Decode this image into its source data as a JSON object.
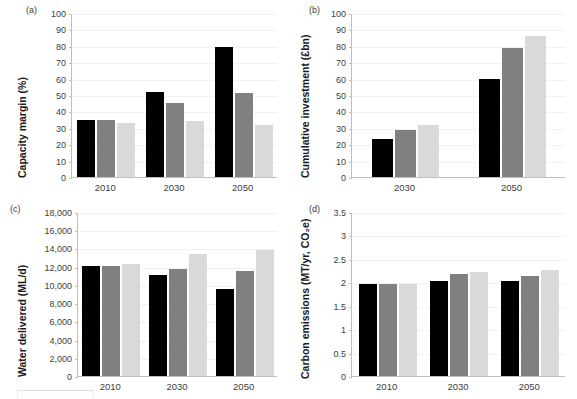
{
  "figure": {
    "panels": [
      {
        "tag": "(a)",
        "ylabel": "Capacity margin (%)",
        "yticks": [
          "0",
          "10",
          "20",
          "30",
          "40",
          "50",
          "60",
          "70",
          "80",
          "90",
          "100"
        ],
        "xticks": [
          "2010",
          "2030",
          "2050"
        ]
      },
      {
        "tag": "(b)",
        "ylabel": "Cumulative investment (£bn)",
        "yticks": [
          "0",
          "10",
          "20",
          "30",
          "40",
          "50",
          "60",
          "70",
          "80",
          "90",
          "100"
        ],
        "xticks": [
          "2030",
          "2050"
        ]
      },
      {
        "tag": "(c)",
        "ylabel": "Water delivered (ML/d)",
        "yticks": [
          "0",
          "2,000",
          "4,000",
          "6,000",
          "8,000",
          "10,000",
          "12,000",
          "14,000",
          "16,000",
          "18,000"
        ],
        "xticks": [
          "2010",
          "2030",
          "2050"
        ]
      },
      {
        "tag": "(d)",
        "ylabel": "Carbon emissions (MT/yr, CO₂e)",
        "yticks": [
          "0",
          "0.5",
          "1",
          "1.5",
          "2",
          "2.5",
          "3",
          "3.5"
        ],
        "xticks": [
          "2010",
          "2030",
          "2050"
        ]
      }
    ],
    "series_colors": [
      "#000000",
      "#808080",
      "#d9d9d9"
    ]
  },
  "chart_data": [
    {
      "type": "bar",
      "panel": "(a)",
      "title": "",
      "xlabel": "",
      "ylabel": "Capacity margin (%)",
      "ylim": [
        0,
        100
      ],
      "ytick_step": 10,
      "grid": true,
      "legend": "none",
      "categories": [
        "2010",
        "2030",
        "2050"
      ],
      "series": [
        {
          "name": "series-1",
          "color": "#000000",
          "values": [
            35,
            52,
            79
          ]
        },
        {
          "name": "series-2",
          "color": "#808080",
          "values": [
            35,
            45,
            51
          ]
        },
        {
          "name": "series-3",
          "color": "#d9d9d9",
          "values": [
            33,
            34,
            32
          ]
        }
      ]
    },
    {
      "type": "bar",
      "panel": "(b)",
      "title": "",
      "xlabel": "",
      "ylabel": "Cumulative investment (£bn)",
      "ylim": [
        0,
        100
      ],
      "ytick_step": 10,
      "grid": true,
      "legend": "none",
      "categories": [
        "2030",
        "2050"
      ],
      "series": [
        {
          "name": "series-1",
          "color": "#000000",
          "values": [
            23,
            59.5
          ]
        },
        {
          "name": "series-2",
          "color": "#808080",
          "values": [
            28.5,
            78.5
          ]
        },
        {
          "name": "series-3",
          "color": "#d9d9d9",
          "values": [
            31.5,
            86
          ]
        }
      ]
    },
    {
      "type": "bar",
      "panel": "(c)",
      "title": "",
      "xlabel": "",
      "ylabel": "Water delivered (ML/d)",
      "ylim": [
        0,
        18000
      ],
      "ytick_step": 2000,
      "grid": true,
      "legend": "none",
      "categories": [
        "2010",
        "2030",
        "2050"
      ],
      "series": [
        {
          "name": "series-1",
          "color": "#000000",
          "values": [
            12100,
            11100,
            9500
          ]
        },
        {
          "name": "series-2",
          "color": "#808080",
          "values": [
            12100,
            11800,
            11500
          ]
        },
        {
          "name": "series-3",
          "color": "#d9d9d9",
          "values": [
            12250,
            13350,
            13850
          ]
        }
      ]
    },
    {
      "type": "bar",
      "panel": "(d)",
      "title": "",
      "xlabel": "",
      "ylabel": "Carbon emissions (MT/yr, CO₂e)",
      "ylim": [
        0,
        3.5
      ],
      "ytick_step": 0.5,
      "grid": true,
      "legend": "none",
      "categories": [
        "2010",
        "2030",
        "2050"
      ],
      "series": [
        {
          "name": "series-1",
          "color": "#000000",
          "values": [
            1.97,
            2.02,
            2.03
          ]
        },
        {
          "name": "series-2",
          "color": "#808080",
          "values": [
            1.97,
            2.18,
            2.13
          ]
        },
        {
          "name": "series-3",
          "color": "#d9d9d9",
          "values": [
            1.97,
            2.23,
            2.26
          ]
        }
      ]
    }
  ]
}
